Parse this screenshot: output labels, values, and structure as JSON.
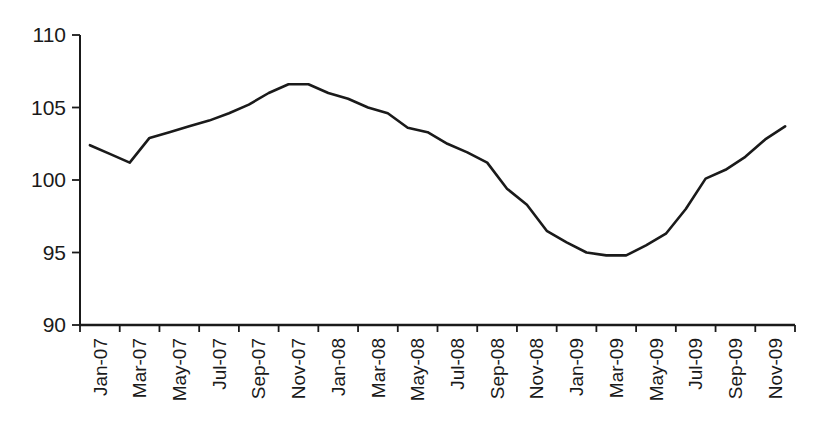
{
  "chart_data": {
    "type": "line",
    "title": "",
    "xlabel": "",
    "ylabel": "",
    "x_categories": [
      "Jan-07",
      "Feb-07",
      "Mar-07",
      "Apr-07",
      "May-07",
      "Jun-07",
      "Jul-07",
      "Aug-07",
      "Sep-07",
      "Oct-07",
      "Nov-07",
      "Dec-07",
      "Jan-08",
      "Feb-08",
      "Mar-08",
      "Apr-08",
      "May-08",
      "Jun-08",
      "Jul-08",
      "Aug-08",
      "Sep-08",
      "Oct-08",
      "Nov-08",
      "Dec-08",
      "Jan-09",
      "Feb-09",
      "Mar-09",
      "Apr-09",
      "May-09",
      "Jun-09",
      "Jul-09",
      "Aug-09",
      "Sep-09",
      "Oct-09",
      "Nov-09",
      "Dec-09"
    ],
    "values": [
      102.4,
      101.8,
      101.2,
      102.9,
      103.3,
      103.7,
      104.1,
      104.6,
      105.2,
      106.0,
      106.6,
      106.6,
      106.0,
      105.6,
      105.0,
      104.6,
      103.6,
      103.3,
      102.5,
      101.9,
      101.2,
      99.4,
      98.3,
      96.5,
      95.7,
      95.0,
      94.8,
      94.8,
      95.5,
      96.3,
      98.0,
      100.1,
      100.7,
      101.6,
      102.8,
      103.7
    ],
    "x_tick_labels": [
      "Jan-07",
      "Mar-07",
      "May-07",
      "Jul-07",
      "Sep-07",
      "Nov-07",
      "Jan-08",
      "Mar-08",
      "May-08",
      "Jul-08",
      "Sep-08",
      "Nov-08",
      "Jan-09",
      "Mar-09",
      "May-09",
      "Jul-09",
      "Sep-09",
      "Nov-09"
    ],
    "x_tick_label_rotation_deg": 90,
    "yticks": [
      90,
      95,
      100,
      105,
      110
    ],
    "ylim": [
      90,
      110
    ],
    "grid": false,
    "legend": "none",
    "line_color": "#1a1a1a",
    "axis_color": "#1a1a1a",
    "background_color": "#ffffff"
  }
}
